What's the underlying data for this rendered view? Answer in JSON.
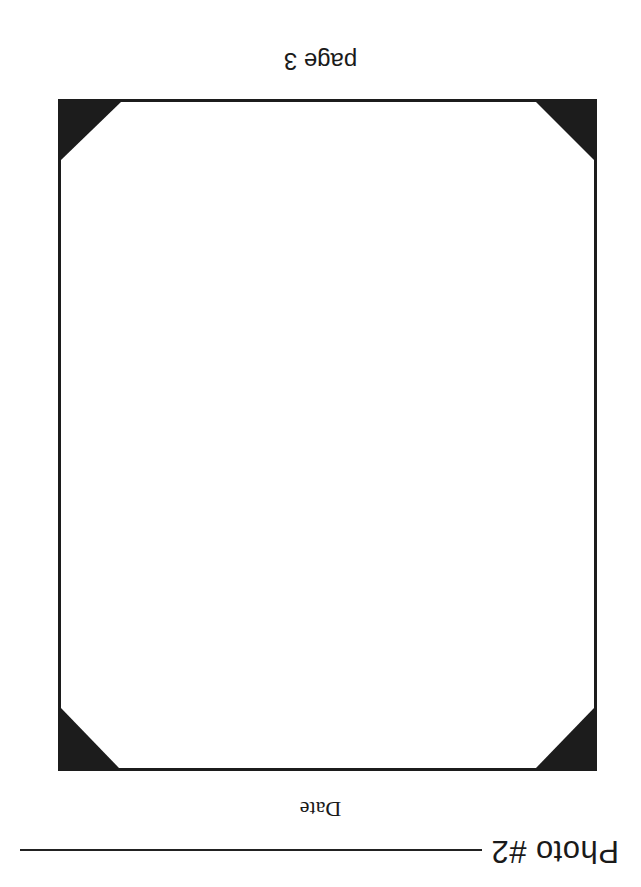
{
  "orientation": "rotated-180",
  "header": {
    "photo_label": "Photo #2",
    "date_label": "Date"
  },
  "frame": {
    "corner_color": "#1c1c1c",
    "corners": [
      "top-left",
      "top-right",
      "bottom-left",
      "bottom-right"
    ]
  },
  "footer": {
    "page_label": "page 3"
  }
}
